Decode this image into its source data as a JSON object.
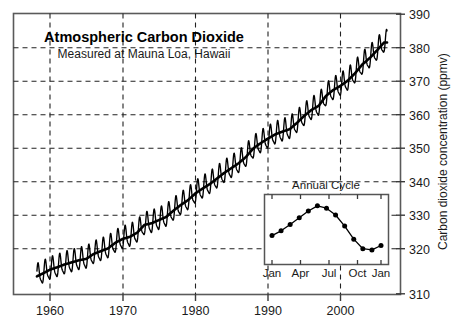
{
  "chart_data": {
    "type": "line",
    "title": "Atmospheric Carbon Dioxide",
    "subtitle": "Measured at Mauna Loa, Hawaii",
    "xlabel": "",
    "ylabel": "Carbon dioxide concentration (ppmv)",
    "xlim": [
      1957.0,
      2007.5
    ],
    "ylim": [
      310,
      390
    ],
    "grid": true,
    "grid_style": "dashed",
    "legend": "none",
    "x_ticks": [
      1960,
      1970,
      1980,
      1990,
      2000
    ],
    "x_tick_labels": [
      "1960",
      "1970",
      "1980",
      "1990",
      "2000"
    ],
    "y_ticks": [
      310,
      320,
      330,
      340,
      350,
      360,
      370,
      380,
      390
    ],
    "y_tick_labels": [
      "310",
      "320",
      "330",
      "340",
      "350",
      "360",
      "370",
      "380",
      "390"
    ],
    "series": [
      {
        "name": "Monthly mean CO2 (with seasonal cycle)",
        "description": "Keeling curve: rising trend with superimposed annual sawtooth oscillation of about 6 ppmv peak-to-peak",
        "color": "#000000",
        "x": [
          1958.2,
          1959,
          1960,
          1961,
          1962,
          1963,
          1964,
          1965,
          1966,
          1967,
          1968,
          1969,
          1970,
          1971,
          1972,
          1973,
          1974,
          1975,
          1976,
          1977,
          1978,
          1979,
          1980,
          1981,
          1982,
          1983,
          1984,
          1985,
          1986,
          1987,
          1988,
          1989,
          1990,
          1991,
          1992,
          1993,
          1994,
          1995,
          1996,
          1997,
          1998,
          1999,
          2000,
          2001,
          2002,
          2003,
          2004,
          2005,
          2006
        ],
        "annual_mean": [
          315.0,
          315.8,
          316.9,
          317.6,
          318.4,
          319.0,
          319.6,
          320.0,
          321.4,
          322.2,
          323.0,
          324.6,
          325.7,
          326.3,
          327.5,
          329.7,
          330.2,
          331.1,
          332.0,
          333.8,
          335.4,
          336.8,
          338.7,
          340.1,
          341.4,
          343.0,
          344.6,
          346.0,
          347.4,
          349.2,
          351.6,
          353.1,
          354.4,
          355.6,
          356.4,
          357.1,
          358.9,
          360.9,
          362.6,
          363.8,
          366.6,
          368.3,
          369.5,
          371.0,
          373.1,
          375.6,
          377.4,
          379.6,
          381.9
        ],
        "seasonal_amplitude_ppmv": 6.0
      }
    ],
    "inset": {
      "title": "Annual Cycle",
      "type": "line",
      "x_tick_labels": [
        "Jan",
        "Apr",
        "Jul",
        "Oct",
        "Jan"
      ],
      "x_tick_months": [
        0,
        3,
        6,
        9,
        12
      ],
      "categories": [
        "Jan",
        "Feb",
        "Mar",
        "Apr",
        "May",
        "Jun",
        "Jul",
        "Aug",
        "Sep",
        "Oct",
        "Nov",
        "Dec",
        "Jan"
      ],
      "values": [
        327.9,
        329.1,
        330.7,
        332.4,
        334.1,
        335.4,
        334.8,
        333.1,
        330.3,
        327.0,
        324.6,
        324.3,
        325.4
      ],
      "values_note": "relative seasonal cycle in ppmv; marker points plotted monthly",
      "ylim": [
        322.0,
        337.0
      ],
      "marker": "filled-circle",
      "grid": false
    }
  },
  "figure": {
    "background_color": "#ffffff",
    "line_color": "#000000",
    "grid_color": "#333333",
    "axis_color": "#4a4a4a",
    "border": true
  }
}
